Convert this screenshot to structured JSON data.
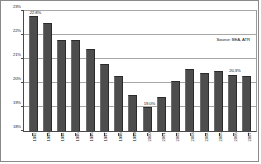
{
  "chart_data": {
    "type": "bar",
    "title": "",
    "subtitle": "",
    "xlabel": "",
    "ylabel": "",
    "ylim": [
      18,
      23
    ],
    "yticks": [
      "18%",
      "19%",
      "20%",
      "21%",
      "22%",
      "23%"
    ],
    "ytick_values": [
      18,
      19,
      20,
      21,
      22,
      23
    ],
    "grid": true,
    "legend": "none",
    "categories": [
      "1992",
      "1993",
      "1994",
      "1995",
      "1996",
      "1997",
      "1998",
      "1999",
      "2000",
      "2001",
      "2002",
      "2003",
      "2004",
      "2005",
      "2006",
      "2007"
    ],
    "values": [
      22.8,
      22.5,
      21.8,
      21.8,
      21.4,
      20.8,
      20.3,
      19.5,
      19.0,
      19.4,
      20.1,
      20.6,
      20.4,
      20.5,
      20.35,
      20.3
    ],
    "point_labels": [
      {
        "category": "1992",
        "text": "22.8%"
      },
      {
        "category": "2000",
        "text": "19.0%"
      },
      {
        "category": "2006",
        "text": "20.3%"
      }
    ],
    "annotations": [
      {
        "name": "source-note",
        "text": "Source: BEA, ATR"
      }
    ]
  },
  "annotation": {
    "source_text": "Source: BEA, ATR"
  },
  "colors": {
    "bar_fill": "#4d4d4d",
    "bar_edge": "#2b2b2b",
    "gridline": "#a8a8a8",
    "axis": "#4a4a4a",
    "frame": "#8a8a8a",
    "text": "#111111",
    "background": "#ffffff"
  }
}
